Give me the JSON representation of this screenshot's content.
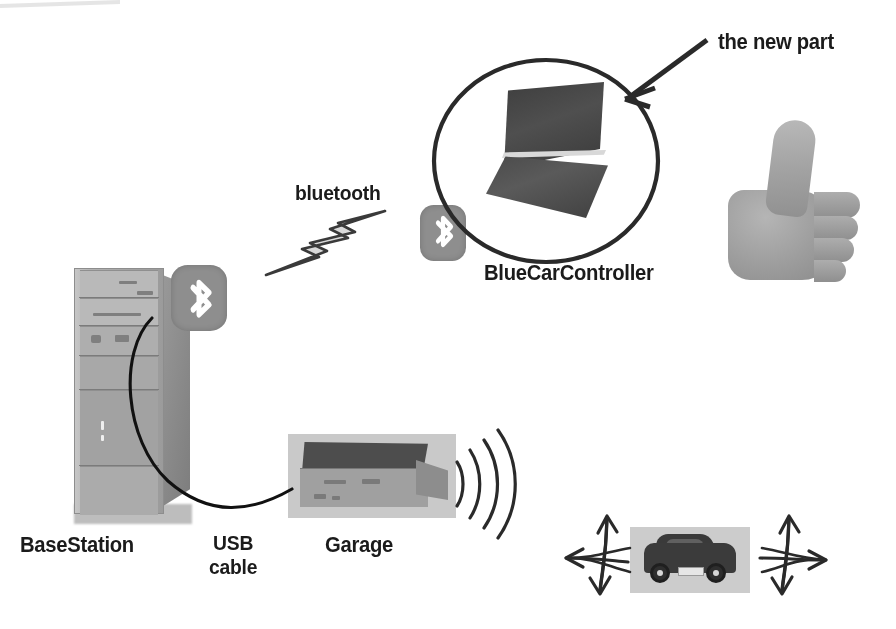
{
  "diagram": {
    "annotation": {
      "text": "the new part"
    },
    "nodes": [
      {
        "id": "basestation",
        "label": "BaseStation",
        "icon": "desktop-tower-icon"
      },
      {
        "id": "usb",
        "label": "USB\ncable",
        "icon": "cable-icon"
      },
      {
        "id": "garage",
        "label": "Garage",
        "icon": "garage-transmitter-icon"
      },
      {
        "id": "controller",
        "label": "BlueCarController",
        "icon": "laptop-icon"
      },
      {
        "id": "car",
        "label": "",
        "icon": "toy-car-icon"
      },
      {
        "id": "approval",
        "label": "",
        "icon": "thumbs-up-icon"
      }
    ],
    "links": [
      {
        "id": "bluetooth-link",
        "label": "bluetooth",
        "icon": "lightning-bolt-icon",
        "from": "basestation",
        "to": "controller"
      },
      {
        "id": "usb-link",
        "label": "USB cable",
        "icon": "cable-icon",
        "from": "basestation",
        "to": "garage"
      },
      {
        "id": "radio-link",
        "label": "",
        "icon": "radio-waves-icon",
        "from": "garage",
        "to": "car"
      }
    ],
    "badges": [
      {
        "id": "bt-basestation",
        "icon": "bluetooth-icon",
        "attached_to": "basestation"
      },
      {
        "id": "bt-controller",
        "icon": "bluetooth-icon",
        "attached_to": "controller"
      }
    ],
    "motion_indicators": [
      {
        "id": "car-motion-left",
        "icon": "multi-direction-arrow-icon",
        "directions": [
          "up",
          "left",
          "down"
        ]
      },
      {
        "id": "car-motion-right",
        "icon": "multi-direction-arrow-icon",
        "directions": [
          "up",
          "right",
          "down"
        ]
      }
    ],
    "highlight": {
      "id": "new-part-oval",
      "shape": "ellipse",
      "encircles": "controller"
    },
    "colors": {
      "ink": "#1b1b1b",
      "outline": "#2a2a2a",
      "badge_gray": "#8e8e8e",
      "bolt_fill": "#d9d9d9",
      "photo_gray": "#a0a0a0",
      "background": "#ffffff"
    }
  }
}
